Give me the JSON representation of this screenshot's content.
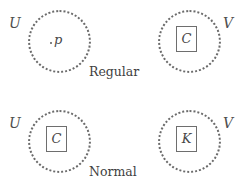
{
  "figure": {
    "background_color": "#ffffff",
    "ink_color": "#4a4a4a",
    "width": 249,
    "height": 190
  },
  "rows": [
    {
      "caption": "Regular",
      "left": {
        "set_label": "U",
        "content_kind": "point",
        "content_label": "p"
      },
      "right": {
        "set_label": "V",
        "content_kind": "boxed-set",
        "content_label": "C"
      }
    },
    {
      "caption": "Normal",
      "left": {
        "set_label": "U",
        "content_kind": "boxed-set",
        "content_label": "C"
      },
      "right": {
        "set_label": "V",
        "content_kind": "boxed-set",
        "content_label": "K"
      }
    }
  ]
}
